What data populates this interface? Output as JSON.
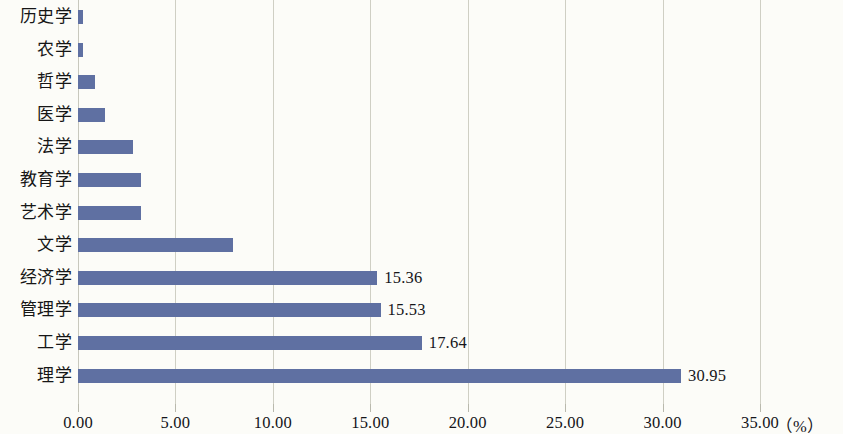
{
  "chart_data": {
    "type": "bar",
    "orientation": "horizontal",
    "title": "",
    "subtitle": "",
    "xlabel": "",
    "ylabel": "",
    "unit_label": "（%）",
    "xlim": [
      0,
      35
    ],
    "grid": true,
    "legend": null,
    "bar_color": "#5f70a2",
    "gridline_color": "#cfcfc4",
    "xticks": [
      "0.00",
      "5.00",
      "10.00",
      "15.00",
      "20.00",
      "25.00",
      "30.00",
      "35.00"
    ],
    "xtick_values": [
      0,
      5,
      10,
      15,
      20,
      25,
      30,
      35
    ],
    "categories": [
      "历史学",
      "农学",
      "哲学",
      "医学",
      "法学",
      "教育学",
      "艺术学",
      "文学",
      "经济学",
      "管理学",
      "工学",
      "理学"
    ],
    "values": [
      0.25,
      0.25,
      0.88,
      1.4,
      2.83,
      3.25,
      3.25,
      7.95,
      15.36,
      15.53,
      17.64,
      30.95
    ],
    "data_labels": [
      "",
      "",
      "",
      "",
      "",
      "",
      "",
      "",
      "15.36",
      "15.53",
      "17.64",
      "30.95"
    ]
  }
}
